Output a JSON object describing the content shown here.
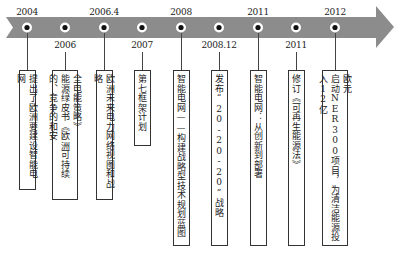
{
  "diagram": {
    "type": "timeline",
    "colors": {
      "band": "#8c8c8c",
      "dot_fill": "#ffffff",
      "dot_center": "#111111",
      "line": "#444444",
      "box_border": "#333333"
    },
    "events": [
      {
        "year": "2004",
        "label_pos": "top",
        "x": 27,
        "box_width": 17,
        "box_height": 120,
        "text_columns": [
          "提出了欧洲要建设智能电网"
        ]
      },
      {
        "year": "2006",
        "label_pos": "bottom",
        "x": 65,
        "box_width": 26,
        "box_height": 130,
        "text_columns": [
          "全电能策略》",
          "能源绿皮书《欧洲可持续的、竞争的和安"
        ]
      },
      {
        "year": "2006.4",
        "label_pos": "top",
        "x": 104,
        "box_width": 17,
        "box_height": 130,
        "text_columns": [
          "欧洲未来电力网络视图和战略"
        ]
      },
      {
        "year": "2007",
        "label_pos": "bottom",
        "x": 142,
        "box_width": 17,
        "box_height": 76,
        "text_columns": [
          "第七框架计划"
        ]
      },
      {
        "year": "2008",
        "label_pos": "top",
        "x": 181,
        "box_width": 17,
        "box_height": 176,
        "text_columns": [
          "智能电网——构建战略型技术规划蓝图"
        ]
      },
      {
        "year": "2008.12",
        "label_pos": "bottom",
        "x": 219,
        "box_width": 17,
        "box_height": 176,
        "text_columns": [
          "发布“20-20-20”战略"
        ]
      },
      {
        "year": "2011",
        "label_pos": "top",
        "x": 258,
        "box_width": 17,
        "box_height": 176,
        "text_columns": [
          "智能电网：从创新到部署"
        ]
      },
      {
        "year": "2011",
        "label_pos": "bottom",
        "x": 296,
        "box_width": 17,
        "box_height": 176,
        "text_columns": [
          "修订《可再生能源法》"
        ]
      },
      {
        "year": "2012",
        "label_pos": "top",
        "x": 335,
        "box_width": 26,
        "box_height": 176,
        "text_columns": [
          "欧元",
          "启动NER300项目，为清洁能源投入12亿"
        ]
      }
    ]
  }
}
